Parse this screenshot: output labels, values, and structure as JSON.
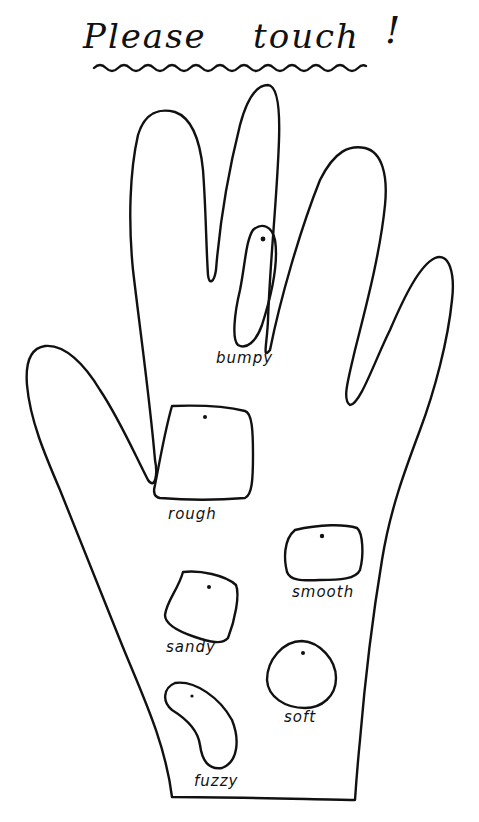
{
  "title": {
    "word1": "Please",
    "word2": "touch",
    "punct": "!"
  },
  "diagram": {
    "stroke_color": "#111111",
    "background": "#ffffff",
    "patches": [
      {
        "id": "bumpy",
        "label": "bumpy",
        "shape": "elongated-oval"
      },
      {
        "id": "rough",
        "label": "rough",
        "shape": "square"
      },
      {
        "id": "smooth",
        "label": "smooth",
        "shape": "rounded-rectangle"
      },
      {
        "id": "sandy",
        "label": "sandy",
        "shape": "rounded-square"
      },
      {
        "id": "soft",
        "label": "soft",
        "shape": "circle"
      },
      {
        "id": "fuzzy",
        "label": "fuzzy",
        "shape": "bean"
      }
    ]
  }
}
